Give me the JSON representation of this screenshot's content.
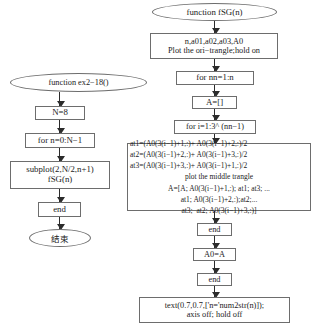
{
  "diagram": {
    "style": {
      "border_color": "#6d6d6d",
      "arrow_color": "#2b2b2b",
      "background": "#ffffff",
      "text_color": "#1b1b1b"
    }
  },
  "left_flow": {
    "start": "function ex2−18()",
    "init": "N=8",
    "loop": "for n=0:N−1",
    "body_line1": "subplot(2,N/2,n+1)",
    "body_line2": "fSG(n)",
    "end": "end",
    "terminator": "结束"
  },
  "right_flow": {
    "start": "function fSG(n)",
    "init_line1": "n,a01,a02,a03,A0",
    "init_line2": "Plot the ori−trangle;hold on",
    "outer_loop": "for nn=1:n",
    "accumulator": "A=[]",
    "inner_loop": "for i=1:3^ (nn−1)",
    "process": {
      "line1": "at1=(A0(3(i−1)+1,:)+ A0(3(i−1)+2,:)/2",
      "line2": "at2=(A0(3(i−1)+2,:)+ A0(3(i−1)+3,:)/2",
      "line3": "at3=(A0(3(i−1)+3,:)+ A0(3(i−1)+1,:)/2",
      "line4": "plot the middle trangle",
      "line5": "A=[A; A0(3(i−1)+1,:); at1; at3; ...",
      "line6": "at1; A0(3(i−1)+2,:);at2;...",
      "line7": "at3;  at2; A0(3(i−1)+3,:)]"
    },
    "inner_end": "end",
    "assign": "A0=A",
    "outer_end": "end",
    "finish_line1": "text(0.7,0.7,['n='num2str(n)]);",
    "finish_line2": "axis off; hold off"
  }
}
